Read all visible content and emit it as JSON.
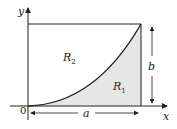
{
  "diagram": {
    "axes": {
      "x_label": "x",
      "y_label": "y",
      "origin_label": "0"
    },
    "regions": [
      {
        "name": "R1",
        "label_base": "R",
        "label_sub": "1",
        "shaded": true,
        "fill": "#e6e6e6"
      },
      {
        "name": "R2",
        "label_base": "R",
        "label_sub": "2",
        "shaded": false,
        "fill": "#ffffff"
      }
    ],
    "dimensions": {
      "width_label": "a",
      "height_label": "b"
    },
    "curve": "increasing convex curve from origin to (a, b)",
    "colors": {
      "line": "#222222",
      "shade": "#e6e6e6"
    }
  }
}
